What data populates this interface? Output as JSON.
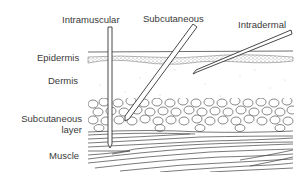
{
  "figure": {
    "needle_labels": {
      "intramuscular": "Intramuscular",
      "subcutaneous": "Subcutaneous",
      "intradermal": "Intradermal"
    },
    "layer_labels": {
      "epidermis": "Epidermis",
      "dermis": "Dermis",
      "subcutaneous_line1": "Subcutaneous",
      "subcutaneous_line2": "layer",
      "muscle": "Muscle"
    },
    "colors": {
      "ink": "#3a3a3a",
      "background": "#ffffff",
      "stipple": "#8a8a8a"
    }
  }
}
